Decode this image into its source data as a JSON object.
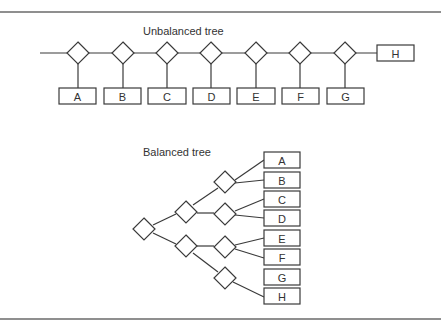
{
  "unbalanced": {
    "title": "Unbalanced tree",
    "leaves": [
      "A",
      "B",
      "C",
      "D",
      "E",
      "F",
      "G"
    ],
    "last_leaf": "H"
  },
  "balanced": {
    "title": "Balanced tree",
    "leaves": [
      "A",
      "B",
      "C",
      "D",
      "E",
      "F",
      "G",
      "H"
    ]
  }
}
